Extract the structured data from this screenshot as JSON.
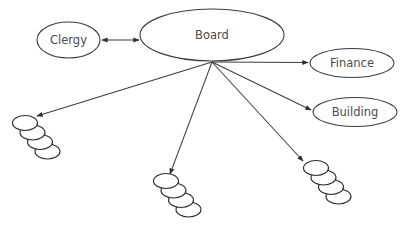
{
  "diagram": {
    "canvas": {
      "width": 414,
      "height": 226,
      "background": "#ffffff"
    },
    "style": {
      "stroke_color": "#3c3c3c",
      "document_stroke_color": "#2e2e2e",
      "text_color": "#4a4a4a",
      "fill_color": "#ffffff"
    },
    "nodes": [
      {
        "id": "clergy",
        "label": "Clergy",
        "shape": "ellipse",
        "cx": 68.5,
        "cy": 40,
        "rx": 31.5,
        "ry": 18
      },
      {
        "id": "board",
        "label": "Board",
        "shape": "ellipse",
        "cx": 212,
        "cy": 35,
        "rx": 72,
        "ry": 26
      },
      {
        "id": "finance",
        "label": "Finance",
        "shape": "ellipse",
        "cx": 352,
        "cy": 63,
        "rx": 42,
        "ry": 14.5
      },
      {
        "id": "building",
        "label": "Building",
        "shape": "ellipse",
        "cx": 355,
        "cy": 112,
        "rx": 42,
        "ry": 14.5
      }
    ],
    "document_stacks": [
      {
        "id": "stack-left",
        "label": "",
        "count": 4,
        "start_cx": 25,
        "start_cy": 123,
        "rx": 12.5,
        "ry": 7.5,
        "dx": 7.5,
        "dy": 9.5
      },
      {
        "id": "stack-middle",
        "label": "",
        "count": 4,
        "start_cx": 166,
        "start_cy": 181,
        "rx": 12.5,
        "ry": 7.5,
        "dx": 7.5,
        "dy": 9.5
      },
      {
        "id": "stack-right",
        "label": "",
        "count": 4,
        "start_cx": 316,
        "start_cy": 168,
        "rx": 12.5,
        "ry": 7.5,
        "dx": 7.5,
        "dy": 9.5
      }
    ],
    "edges": [
      {
        "id": "edge-board-clergy",
        "from": "board",
        "to": "clergy",
        "x1": 140,
        "y1": 40,
        "x2": 101,
        "y2": 40,
        "arrow_start": true,
        "arrow_end": true
      },
      {
        "id": "edge-board-finance",
        "from": "board",
        "to": "finance",
        "x1": 212,
        "y1": 62,
        "x2": 308,
        "y2": 62.5,
        "arrow_start": false,
        "arrow_end": true
      },
      {
        "id": "edge-board-building",
        "from": "board",
        "to": "building",
        "x1": 212,
        "y1": 62,
        "x2": 311,
        "y2": 110,
        "arrow_start": false,
        "arrow_end": true
      },
      {
        "id": "edge-board-stack-left",
        "from": "board",
        "to": "stack-left",
        "x1": 212,
        "y1": 62,
        "x2": 37,
        "y2": 116,
        "arrow_start": false,
        "arrow_end": true
      },
      {
        "id": "edge-board-stack-middle",
        "from": "board",
        "to": "stack-middle",
        "x1": 212,
        "y1": 62,
        "x2": 170,
        "y2": 174,
        "arrow_start": false,
        "arrow_end": true
      },
      {
        "id": "edge-board-stack-right",
        "from": "board",
        "to": "stack-right",
        "x1": 212,
        "y1": 62,
        "x2": 303,
        "y2": 161,
        "arrow_start": false,
        "arrow_end": true
      }
    ]
  }
}
